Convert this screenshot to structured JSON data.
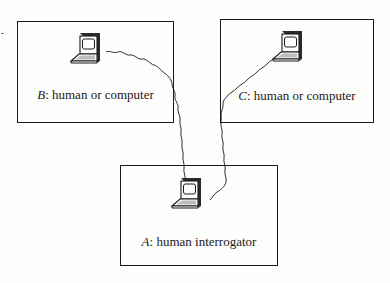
{
  "diagram": {
    "type": "Turing test (imitation game) setup",
    "nodes": [
      {
        "id": "B",
        "letter": "B",
        "separator": ": ",
        "description": "human or computer",
        "icon": "computer-terminal-icon"
      },
      {
        "id": "C",
        "letter": "C",
        "separator": ": ",
        "description": "human or computer",
        "icon": "computer-terminal-icon"
      },
      {
        "id": "A",
        "letter": "A",
        "separator": ": ",
        "description": "human interrogator",
        "icon": "computer-terminal-icon"
      }
    ],
    "edges": [
      {
        "from": "B",
        "to": "A",
        "style": "wavy-cable"
      },
      {
        "from": "C",
        "to": "A",
        "style": "wavy-cable"
      }
    ],
    "colors": {
      "line": "#1a1a1a",
      "background": "#fdfdfb",
      "screen_shade": "#2a2a2a",
      "keyboard_fill": "#bdbdbd"
    }
  }
}
